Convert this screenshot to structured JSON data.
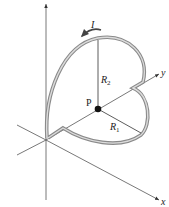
{
  "figure": {
    "labels": {
      "current": "I",
      "point": "P",
      "radius_large": "R",
      "radius_large_sub": "2",
      "radius_small": "R",
      "radius_small_sub": "1",
      "axis_x": "x",
      "axis_y": "y"
    },
    "colors": {
      "wire_outer": "#8a8a8a",
      "wire_inner": "#d9d9d9",
      "axis": "#333333",
      "point": "#111111"
    }
  }
}
